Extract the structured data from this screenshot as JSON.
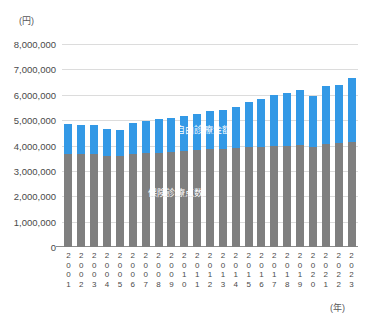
{
  "chart_data": {
    "type": "bar",
    "stacked": true,
    "title": "",
    "xlabel": "(年)",
    "ylabel": "(円)",
    "ylim": [
      0,
      8000000
    ],
    "ytick_values": [
      0,
      1000000,
      2000000,
      3000000,
      4000000,
      5000000,
      6000000,
      7000000,
      8000000
    ],
    "ytick_labels": [
      "0",
      "1,000,000",
      "2,000,000",
      "3,000,000",
      "4,000,000",
      "5,000,000",
      "6,000,000",
      "7,000,000",
      "8,000,000"
    ],
    "grid": true,
    "legend_position": "inline-on-bars",
    "categories": [
      "2001",
      "2002",
      "2003",
      "2004",
      "2005",
      "2006",
      "2007",
      "2008",
      "2009",
      "2010",
      "2011",
      "2012",
      "2013",
      "2014",
      "2015",
      "2016",
      "2017",
      "2018",
      "2019",
      "2020",
      "2021",
      "2022",
      "2023"
    ],
    "series": [
      {
        "name": "保険診療点数",
        "color": "#7f7f7f",
        "values": [
          3680000,
          3660000,
          3650000,
          3600000,
          3600000,
          3660000,
          3700000,
          3710000,
          3760000,
          3800000,
          3830000,
          3860000,
          3880000,
          3900000,
          3930000,
          3950000,
          3980000,
          4000000,
          4020000,
          3960000,
          4050000,
          4080000,
          4120000
        ]
      },
      {
        "name": "自由診療金額",
        "color": "#3399e6",
        "values": [
          1170000,
          1140000,
          1160000,
          1040000,
          1030000,
          1230000,
          1260000,
          1340000,
          1330000,
          1350000,
          1400000,
          1500000,
          1520000,
          1630000,
          1790000,
          1900000,
          2010000,
          2070000,
          2180000,
          2000000,
          2300000,
          2320000,
          2530000
        ]
      }
    ],
    "totals": [
      4850000,
      4800000,
      4810000,
      4640000,
      4630000,
      4890000,
      4960000,
      5050000,
      5090000,
      5150000,
      5230000,
      5360000,
      5400000,
      5530000,
      5720000,
      5850000,
      5990000,
      6070000,
      6200000,
      5960000,
      6350000,
      6400000,
      6650000
    ]
  },
  "axis": {
    "y_unit": "(円)",
    "x_unit": "(年)"
  }
}
